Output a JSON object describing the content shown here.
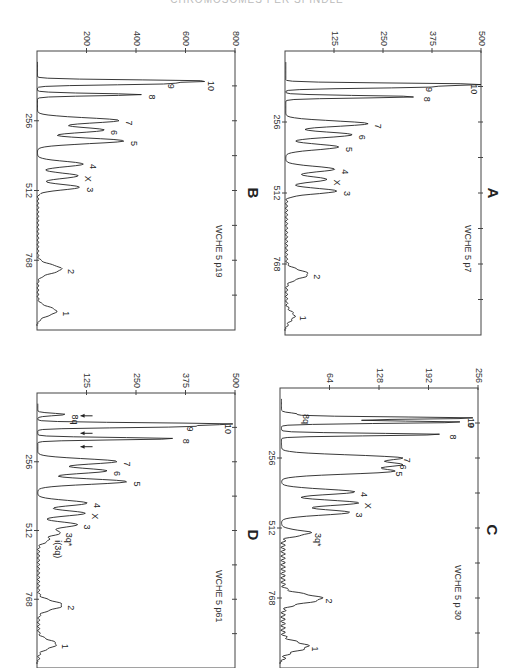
{
  "header": {
    "title": "CHROMOSOMES PER SPINDLE"
  },
  "chart_data": [
    {
      "panel": "A",
      "type": "line",
      "title": "WCHE 5 p7",
      "xlabel": "Channel (DNA content)",
      "ylabel": "Counts",
      "x_ticks": [
        256,
        512,
        768
      ],
      "y_ticks": [
        125,
        250,
        375,
        500
      ],
      "ylim": [
        0,
        500
      ],
      "xlim": [
        0,
        1024
      ],
      "peaks": [
        {
          "label": "10",
          "x": 120,
          "y": 490
        },
        {
          "label": "9",
          "x": 130,
          "y": 340
        },
        {
          "label": "8",
          "x": 165,
          "y": 335
        },
        {
          "label": "7",
          "x": 262,
          "y": 210
        },
        {
          "label": "6",
          "x": 302,
          "y": 170
        },
        {
          "label": "5",
          "x": 346,
          "y": 135
        },
        {
          "label": "4",
          "x": 426,
          "y": 125
        },
        {
          "label": "X",
          "x": 463,
          "y": 105
        },
        {
          "label": "3",
          "x": 505,
          "y": 130
        },
        {
          "label": "2",
          "x": 805,
          "y": 55
        },
        {
          "label": "1",
          "x": 955,
          "y": 20
        }
      ]
    },
    {
      "panel": "B",
      "type": "line",
      "title": "WCHE 5 p19",
      "xlabel": "Channel (DNA content)",
      "ylabel": "Counts",
      "x_ticks": [
        256,
        512,
        768
      ],
      "y_ticks": [
        200,
        400,
        600,
        800
      ],
      "ylim": [
        0,
        800
      ],
      "xlim": [
        0,
        1024
      ],
      "peaks": [
        {
          "label": "10",
          "x": 110,
          "y": 660
        },
        {
          "label": "9",
          "x": 120,
          "y": 500
        },
        {
          "label": "8",
          "x": 160,
          "y": 420
        },
        {
          "label": "7",
          "x": 255,
          "y": 330
        },
        {
          "label": "6",
          "x": 290,
          "y": 270
        },
        {
          "label": "5",
          "x": 330,
          "y": 350
        },
        {
          "label": "4",
          "x": 415,
          "y": 185
        },
        {
          "label": "X",
          "x": 458,
          "y": 165
        },
        {
          "label": "3",
          "x": 500,
          "y": 170
        },
        {
          "label": "2",
          "x": 800,
          "y": 95
        },
        {
          "label": "1",
          "x": 955,
          "y": 75
        }
      ]
    },
    {
      "panel": "C",
      "type": "line",
      "title": "WCHE 5 p 30",
      "xlabel": "Channel (DNA content)",
      "ylabel": "Counts",
      "x_ticks": [
        256,
        512,
        768
      ],
      "y_ticks": [
        64,
        128,
        192,
        256
      ],
      "ylim": [
        0,
        256
      ],
      "xlim": [
        0,
        1024
      ],
      "peaks": [
        {
          "label": "8q",
          "x": 95,
          "y": 20
        },
        {
          "label": "10",
          "x": 110,
          "y": 254
        },
        {
          "label": "9",
          "x": 125,
          "y": 236
        },
        {
          "label": "8",
          "x": 170,
          "y": 210
        },
        {
          "label": "7",
          "x": 255,
          "y": 150
        },
        {
          "label": "6",
          "x": 280,
          "y": 145
        },
        {
          "label": "5",
          "x": 305,
          "y": 140
        },
        {
          "label": "4",
          "x": 380,
          "y": 95
        },
        {
          "label": "X",
          "x": 420,
          "y": 100
        },
        {
          "label": "3",
          "x": 455,
          "y": 88
        },
        {
          "label": "3q*",
          "x": 530,
          "y": 35
        },
        {
          "label": "2",
          "x": 770,
          "y": 50
        },
        {
          "label": "1",
          "x": 945,
          "y": 32
        }
      ]
    },
    {
      "panel": "D",
      "type": "line",
      "title": "WCHE 5 p61",
      "xlabel": "Channel (DNA content)",
      "ylabel": "Counts",
      "x_ticks": [
        256,
        512,
        768
      ],
      "y_ticks": [
        125,
        250,
        375,
        500
      ],
      "ylim": [
        0,
        500
      ],
      "xlim": [
        0,
        1024
      ],
      "peaks": [
        {
          "label": "8q",
          "x": 80,
          "y": 70
        },
        {
          "label": "10",
          "x": 115,
          "y": 470
        },
        {
          "label": "9",
          "x": 125,
          "y": 360
        },
        {
          "label": "8",
          "x": 170,
          "y": 350
        },
        {
          "label": "7",
          "x": 255,
          "y": 200
        },
        {
          "label": "6",
          "x": 290,
          "y": 175
        },
        {
          "label": "5",
          "x": 330,
          "y": 225
        },
        {
          "label": "4",
          "x": 410,
          "y": 125
        },
        {
          "label": "X",
          "x": 448,
          "y": 120
        },
        {
          "label": "3",
          "x": 490,
          "y": 100
        },
        {
          "label": "3q*",
          "x": 520,
          "y": 55
        },
        {
          "label": "i(3q)",
          "x": 548,
          "y": 25
        },
        {
          "label": "2",
          "x": 790,
          "y": 60
        },
        {
          "label": "1",
          "x": 935,
          "y": 45
        }
      ],
      "annotations": [
        "arrows marking 8q",
        "arrows marking minor peaks near 9 and 8"
      ]
    }
  ]
}
